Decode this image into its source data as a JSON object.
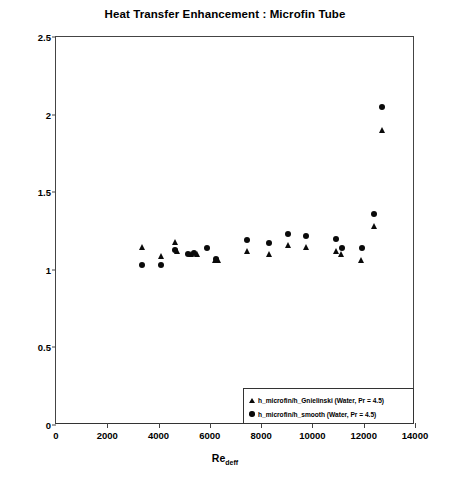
{
  "chart_data": {
    "type": "scatter",
    "title": "Heat Transfer Enhancement : Microfin Tube",
    "xlabel": "Re",
    "xlabel_sub": "deff",
    "ylabel_html": "(h_barI) microfin / (h_barh) smooth",
    "ylabel_main": "(h",
    "ylabel_sub1": "barI",
    "ylabel_mid": ") microfin / (h",
    "ylabel_sub2": "barh",
    "ylabel_end": ") smooth",
    "xlim": [
      0,
      14000
    ],
    "ylim": [
      0,
      2.5
    ],
    "xticks": [
      0,
      2000,
      4000,
      6000,
      8000,
      10000,
      12000,
      14000
    ],
    "xtick_labels": [
      "0",
      "2000",
      "4000",
      "6000",
      "8000",
      "10000",
      "12000",
      "14000"
    ],
    "yticks": [
      0,
      0.5,
      1,
      1.5,
      2,
      2.5
    ],
    "ytick_labels": [
      "0",
      "0.5",
      "1",
      "1.5",
      "2",
      "2.5"
    ],
    "grid": false,
    "legend_position": "bottom-right",
    "marker_color": "#0a0a0a",
    "series": [
      {
        "name": "h_microfin/h_Gnielinski (Water, Pr = 4.5)",
        "marker": "triangle",
        "points": [
          {
            "x": 3350,
            "y": 1.15
          },
          {
            "x": 4100,
            "y": 1.09
          },
          {
            "x": 4650,
            "y": 1.18
          },
          {
            "x": 4700,
            "y": 1.12
          },
          {
            "x": 5250,
            "y": 1.1
          },
          {
            "x": 5500,
            "y": 1.1
          },
          {
            "x": 6200,
            "y": 1.06
          },
          {
            "x": 6300,
            "y": 1.06
          },
          {
            "x": 7450,
            "y": 1.12
          },
          {
            "x": 8300,
            "y": 1.1
          },
          {
            "x": 9050,
            "y": 1.16
          },
          {
            "x": 9750,
            "y": 1.15
          },
          {
            "x": 10900,
            "y": 1.12
          },
          {
            "x": 11100,
            "y": 1.1
          },
          {
            "x": 11900,
            "y": 1.06
          },
          {
            "x": 12400,
            "y": 1.28
          },
          {
            "x": 12700,
            "y": 1.9
          }
        ]
      },
      {
        "name": "h_microfin/h_smooth (Water, Pr = 4.5)",
        "marker": "circle",
        "points": [
          {
            "x": 3350,
            "y": 1.03
          },
          {
            "x": 4100,
            "y": 1.03
          },
          {
            "x": 4650,
            "y": 1.13
          },
          {
            "x": 5150,
            "y": 1.1
          },
          {
            "x": 5400,
            "y": 1.11
          },
          {
            "x": 5900,
            "y": 1.14
          },
          {
            "x": 6250,
            "y": 1.07
          },
          {
            "x": 7450,
            "y": 1.19
          },
          {
            "x": 8300,
            "y": 1.17
          },
          {
            "x": 9050,
            "y": 1.23
          },
          {
            "x": 9750,
            "y": 1.22
          },
          {
            "x": 10900,
            "y": 1.2
          },
          {
            "x": 11150,
            "y": 1.14
          },
          {
            "x": 11950,
            "y": 1.14
          },
          {
            "x": 12400,
            "y": 1.36
          },
          {
            "x": 12700,
            "y": 2.05
          }
        ]
      }
    ]
  },
  "legend": {
    "items": [
      {
        "marker": "triangle",
        "label": "h_microfin/h_Gnielinski (Water, Pr = 4.5)"
      },
      {
        "marker": "circle",
        "label": "h_microfin/h_smooth (Water, Pr = 4.5)"
      }
    ]
  },
  "caption": ""
}
